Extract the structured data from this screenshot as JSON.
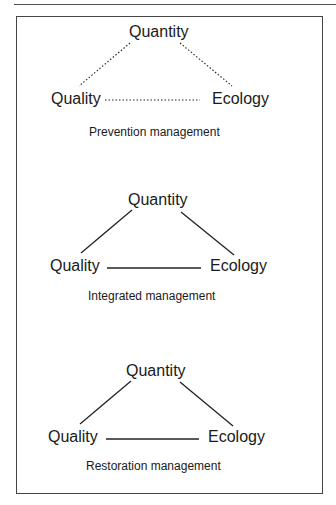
{
  "figure": {
    "panels": [
      {
        "id": "prevention",
        "caption": "Prevention management",
        "line_style": "dotted",
        "nodes": {
          "top": "Quantity",
          "left": "Quality",
          "right": "Ecology"
        }
      },
      {
        "id": "integrated",
        "caption": "Integrated management",
        "line_style": "solid",
        "nodes": {
          "top": "Quantity",
          "left": "Quality",
          "right": "Ecology"
        }
      },
      {
        "id": "restoration",
        "caption": "Restoration management",
        "line_style": "solid",
        "nodes": {
          "top": "Quantity",
          "left": "Quality",
          "right": "Ecology"
        }
      }
    ],
    "colors": {
      "line": "#1a1a1a",
      "text": "#1a1a1a",
      "frame": "#444444"
    }
  }
}
